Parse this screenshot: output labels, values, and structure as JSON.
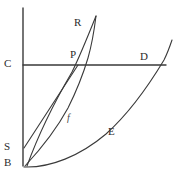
{
  "figure": {
    "type": "geometric-diagram",
    "background_color": "#ffffff",
    "stroke_color": "#3a3a3a",
    "label_color": "#2b2b2b",
    "axes": {
      "vertical_axis": {
        "name": "vertical-axis",
        "x": 23,
        "y_top": 8,
        "y_bottom": 166
      },
      "horizontal_line": {
        "name": "line-CD",
        "y": 65,
        "x_start": 23,
        "x_end": 166
      }
    },
    "curves": [
      {
        "name": "curve-R",
        "label": "R",
        "description": "steep rising curve through P toward R",
        "path": "M 27 166 C 40 130 58 96 72 72 C 80 56 88 36 96 16"
      },
      {
        "name": "curve-f",
        "label": "f",
        "description": "convex curve f from B rising through P",
        "path": "M 25 166 C 38 152 55 132 68 108 C 76 92 82 78 88 58 C 92 44 94 32 96 16"
      },
      {
        "name": "curve-E",
        "label": "E",
        "description": "shallow convex curve E from B rising to the right",
        "path": "M 24 167 C 50 168 80 156 106 134 C 126 116 146 90 164 60 C 168 52 170 46 172 40"
      },
      {
        "name": "segment-SP",
        "label": "",
        "description": "straight segment from S up to P",
        "path": "M 24 148 L 78 65"
      }
    ],
    "labels": [
      {
        "name": "label-C",
        "text": "C",
        "x": 4,
        "y": 58,
        "italic": false
      },
      {
        "name": "label-P",
        "text": "P",
        "x": 70,
        "y": 49,
        "italic": false
      },
      {
        "name": "label-D",
        "text": "D",
        "x": 140,
        "y": 51,
        "italic": false
      },
      {
        "name": "label-R",
        "text": "R",
        "x": 74,
        "y": 17,
        "italic": false
      },
      {
        "name": "label-S",
        "text": "S",
        "x": 4,
        "y": 141,
        "italic": false
      },
      {
        "name": "label-B",
        "text": "B",
        "x": 4,
        "y": 157,
        "italic": false
      },
      {
        "name": "label-E",
        "text": "E",
        "x": 108,
        "y": 126,
        "italic": false
      },
      {
        "name": "label-f",
        "text": "f",
        "x": 67,
        "y": 112,
        "italic": true
      }
    ]
  }
}
